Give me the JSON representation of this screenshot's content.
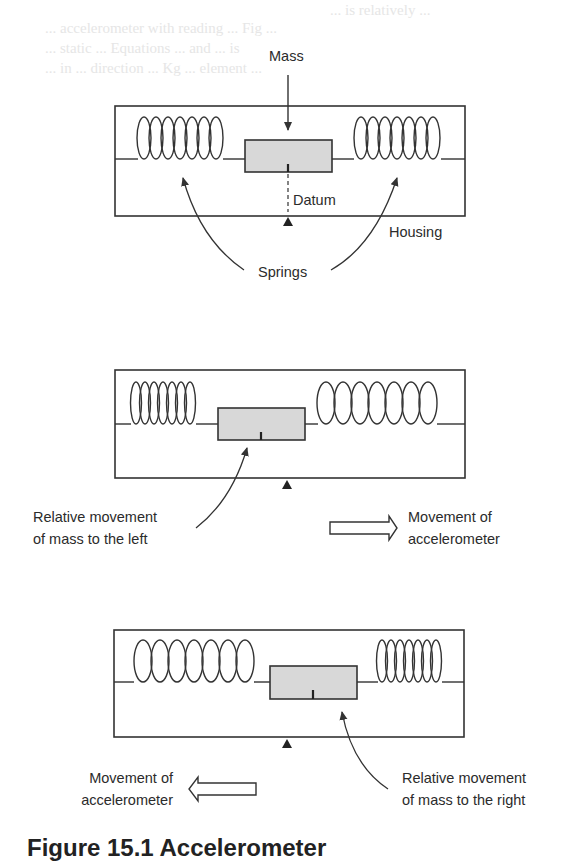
{
  "background_text": [
    "... is relatively ...",
    "... accelerometer with reading ... Fig ...",
    "... static ... Equations ... and ... is",
    "... in ... direction ... Kg ... element ... "
  ],
  "diagram_1": {
    "title": "At rest",
    "labels": {
      "mass": "Mass",
      "datum": "Datum",
      "housing": "Housing",
      "springs": "Springs"
    }
  },
  "diagram_2": {
    "relative_label_line1": "Relative movement",
    "relative_label_line2": "of mass to the left",
    "movement_label_line1": "Movement of",
    "movement_label_line2": "accelerometer",
    "arrow_direction": "right"
  },
  "diagram_3": {
    "movement_label_line1": "Movement of",
    "movement_label_line2": "accelerometer",
    "relative_label_line1": "Relative movement",
    "relative_label_line2": "of mass to the right",
    "arrow_direction": "left"
  },
  "caption": "Figure 15.1 Accelerometer",
  "colors": {
    "line": "#333333",
    "mass_fill": "#d8d8d8",
    "text": "#2b2b2b"
  }
}
